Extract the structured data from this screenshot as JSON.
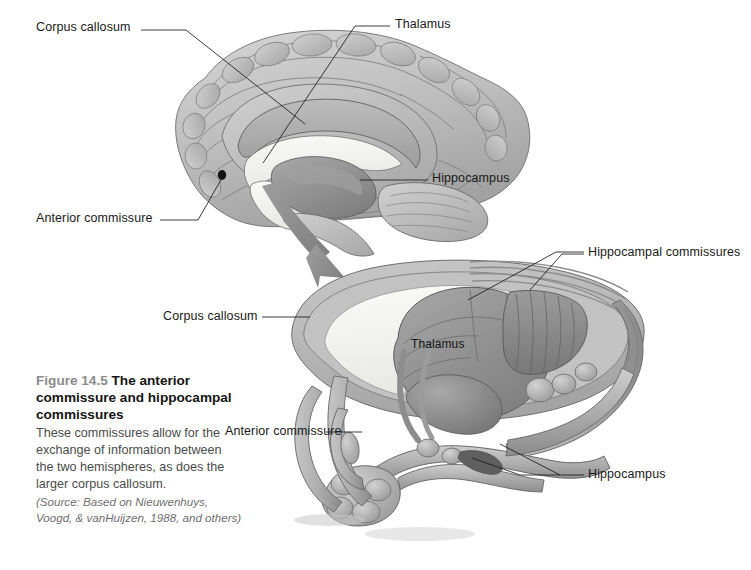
{
  "figure": {
    "background_color": "#ffffff",
    "width": 751,
    "height": 570,
    "caption": {
      "figure_number": "Figure 14.5",
      "title": "The anterior commissure and hippocampal commissures",
      "body": "These commissures allow for the exchange of information between the two hemispheres, as does the larger corpus callosum.",
      "source": "(Source: Based on Nieuwenhuys, Voogd, & vanHuijzen, 1988, and others)"
    },
    "palette": {
      "text_black": "#141414",
      "text_gray": "#4b4b4b",
      "fig_no_gray": "#8b8b8b",
      "source_gray": "#6f6f6f",
      "leader_line": "#1a1a1a",
      "cortex_light": "#cdcdcd",
      "cortex_mid": "#b4b4b4",
      "cortex_dark": "#9a9a9a",
      "corpus_callosum": "#aeaeae",
      "ventricle_white": "#f4f4f2",
      "thalamus_gray": "#8d8d8d",
      "deep_shadow": "#6d6d6d",
      "arrow_gray": "#8f8f8f"
    }
  },
  "labels": {
    "upper": [
      {
        "id": "corpus-callosum",
        "text": "Corpus callosum",
        "x": 36,
        "y": 26
      },
      {
        "id": "thalamus",
        "text": "Thalamus",
        "x": 395,
        "y": 23
      },
      {
        "id": "hippocampus",
        "text": "Hippocampus",
        "x": 432,
        "y": 174
      },
      {
        "id": "anterior-commissure",
        "text": "Anterior commissure",
        "x": 36,
        "y": 216
      }
    ],
    "lower": [
      {
        "id": "hippocampal-commissures",
        "text": "Hippocampal commissures",
        "x": 588,
        "y": 249
      },
      {
        "id": "corpus-callosum-2",
        "text": "Corpus callosum",
        "x": 163,
        "y": 313
      },
      {
        "id": "thalamus-2",
        "text": "Thalamus",
        "x": 411,
        "y": 340
      },
      {
        "id": "anterior-commissure-2",
        "text": "Anterior commissure",
        "x": 225,
        "y": 428
      },
      {
        "id": "hippocampus-2",
        "text": "Hippocampus",
        "x": 588,
        "y": 471
      }
    ]
  },
  "diagrams": [
    {
      "id": "midsagittal-brain",
      "name": "Midsagittal section of human brain",
      "structures": [
        "cerebral cortex",
        "corpus callosum",
        "lateral ventricle",
        "thalamus",
        "anterior commissure",
        "brainstem",
        "cerebellum"
      ]
    },
    {
      "id": "limbic-commissures",
      "name": "Three-dimensional view of corpus callosum, hippocampus and commissures",
      "structures": [
        "corpus callosum",
        "thalamus",
        "hippocampus",
        "hippocampal commissures",
        "anterior commissure",
        "fornix"
      ]
    }
  ],
  "connector_arrow": {
    "id": "zoom-arrow",
    "from": "thalamus region of midsagittal brain",
    "to": "upper surface of three-dimensional limbic diagram"
  }
}
